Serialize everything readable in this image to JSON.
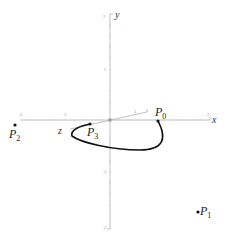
{
  "diagram": {
    "type": "3d-coordinate-axes-with-bezier-curve",
    "axes": {
      "x": {
        "label": "x",
        "tick_labels": [
          "-2",
          "-1",
          "1",
          "2"
        ]
      },
      "y": {
        "label": "y",
        "tick_labels": [
          "2",
          "1",
          "-1",
          "-2"
        ]
      },
      "z": {
        "label": "z",
        "tick_labels": [
          "1",
          "2"
        ]
      }
    },
    "points": [
      {
        "name": "P",
        "subscript": "0",
        "x": 158,
        "y": 121
      },
      {
        "name": "P",
        "subscript": "1",
        "x": 198,
        "y": 212
      },
      {
        "name": "P",
        "subscript": "2",
        "x": 15,
        "y": 125
      },
      {
        "name": "P",
        "subscript": "3",
        "x": 90,
        "y": 124
      }
    ],
    "curve": {
      "from": "P0",
      "to": "P3",
      "color": "#111111"
    },
    "colors": {
      "axis": "#b0b0b0",
      "curve": "#111111",
      "point": "#111111"
    }
  }
}
